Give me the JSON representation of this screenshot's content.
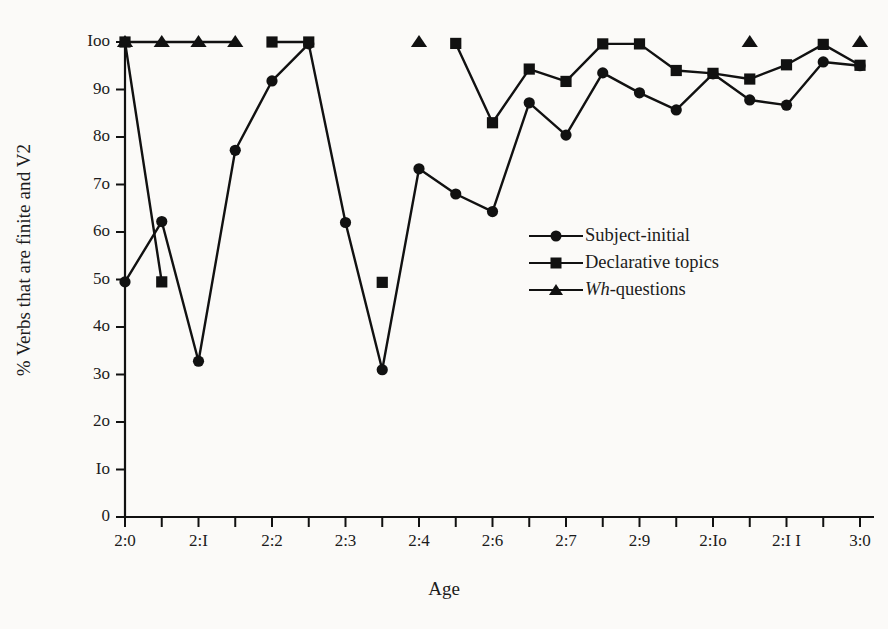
{
  "chart_data": {
    "type": "line",
    "title": "",
    "xlabel": "Age",
    "ylabel": "% Verbs that are finite and V2",
    "ylim": [
      0,
      100
    ],
    "ytick_values": [
      0,
      10,
      20,
      30,
      40,
      50,
      60,
      70,
      80,
      90,
      100
    ],
    "ytick_labels": [
      "0",
      "Io",
      "2o",
      "3o",
      "4o",
      "5o",
      "6o",
      "7o",
      "8o",
      "9o",
      "Ioo"
    ],
    "xtick_labels": [
      "2:0",
      "2:I",
      "2:2",
      "2:3",
      "2:4",
      "2:6",
      "2:7",
      "2:9",
      "2:Io",
      "2:I I",
      "3:0"
    ],
    "xtick_index": [
      0,
      2,
      4,
      6,
      8,
      10,
      12,
      14,
      16,
      18,
      20
    ],
    "x_minor_ticks": 21,
    "grid": false,
    "legend_position": "center-right",
    "series": [
      {
        "name": "Subject-initial",
        "marker": "circle",
        "points": [
          {
            "i": 0,
            "x": "2:0",
            "y": 49.5
          },
          {
            "i": 1,
            "x": "2:0.5",
            "y": 62.2
          },
          {
            "i": 2,
            "x": "2:1",
            "y": 32.8
          },
          {
            "i": 3,
            "x": "2:1.5",
            "y": 77.2
          },
          {
            "i": 4,
            "x": "2:2",
            "y": 91.8
          },
          {
            "i": 5,
            "x": "2:2.5",
            "y": 99.6
          },
          {
            "i": 6,
            "x": "2:3",
            "y": 62.0
          },
          {
            "i": 7,
            "x": "2:3.5",
            "y": 31.0
          },
          {
            "i": 8,
            "x": "2:4",
            "y": 73.3
          },
          {
            "i": 9,
            "x": "2:4.5",
            "y": 68.0
          },
          {
            "i": 10,
            "x": "2:5",
            "y": 64.3
          },
          {
            "i": 11,
            "x": "2:5.5",
            "y": 87.2
          },
          {
            "i": 12,
            "x": "2:6",
            "y": 80.4
          },
          {
            "i": 13,
            "x": "2:6.5",
            "y": 93.5
          },
          {
            "i": 14,
            "x": "2:7",
            "y": 89.3
          },
          {
            "i": 15,
            "x": "2:7.5",
            "y": 85.7
          },
          {
            "i": 16,
            "x": "2:8",
            "y": 93.3
          },
          {
            "i": 17,
            "x": "2:8.5",
            "y": 87.8
          },
          {
            "i": 18,
            "x": "2:9",
            "y": 86.7
          },
          {
            "i": 19,
            "x": "2:9.5",
            "y": 95.8
          },
          {
            "i": 20,
            "x": "2:10",
            "y": 95.0
          }
        ]
      },
      {
        "name": "Declarative topics",
        "marker": "square",
        "points": [
          {
            "i": 0,
            "x": "2:0",
            "y": 100
          },
          {
            "i": 1,
            "x": "2:0.5",
            "y": 49.5
          },
          {
            "i": 4,
            "x": "2:2",
            "y": 100
          },
          {
            "i": 5,
            "x": "2:2.5",
            "y": 100
          },
          {
            "i": 7,
            "x": "2:3.5",
            "y": 49.4
          },
          {
            "i": 9,
            "x": "2:4.5",
            "y": 99.7
          },
          {
            "i": 10,
            "x": "2:5",
            "y": 83.0
          },
          {
            "i": 11,
            "x": "2:5.5",
            "y": 94.3
          },
          {
            "i": 12,
            "x": "2:6",
            "y": 91.7
          },
          {
            "i": 13,
            "x": "2:6.5",
            "y": 99.6
          },
          {
            "i": 14,
            "x": "2:7",
            "y": 99.6
          },
          {
            "i": 15,
            "x": "2:7.5",
            "y": 94.0
          },
          {
            "i": 16,
            "x": "2:8",
            "y": 93.4
          },
          {
            "i": 17,
            "x": "2:8.5",
            "y": 92.2
          },
          {
            "i": 18,
            "x": "2:9",
            "y": 95.2
          },
          {
            "i": 19,
            "x": "2:9.5",
            "y": 99.5
          },
          {
            "i": 20,
            "x": "2:10",
            "y": 95.1
          }
        ]
      },
      {
        "name": "Wh-questions",
        "marker": "triangle",
        "italic_prefix": "Wh",
        "label_suffix": "-questions",
        "points": [
          {
            "i": 0,
            "x": "2:0",
            "y": 100
          },
          {
            "i": 1,
            "x": "2:0.5",
            "y": 100
          },
          {
            "i": 2,
            "x": "2:1",
            "y": 100
          },
          {
            "i": 3,
            "x": "2:1.5",
            "y": 100
          },
          {
            "i": 8,
            "x": "2:4",
            "y": 100
          },
          {
            "i": 17,
            "x": "2:8.5",
            "y": 100
          },
          {
            "i": 20,
            "x": "2:10",
            "y": 100
          }
        ]
      }
    ]
  },
  "legend": {
    "items": [
      {
        "label": "Subject-initial",
        "marker": "circle"
      },
      {
        "label": "Declarative topics",
        "marker": "square"
      },
      {
        "label": "-questions",
        "italic": "Wh",
        "marker": "triangle"
      }
    ]
  },
  "colors": {
    "ink": "#111111",
    "background": "#fbfaf8"
  }
}
